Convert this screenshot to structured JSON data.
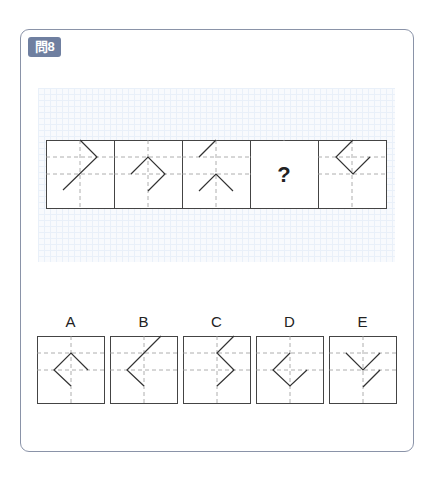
{
  "question": {
    "badge": "問8"
  },
  "sequence": {
    "panel_size": 68,
    "top": 140,
    "panels": [
      {
        "x": 46,
        "shape": [
          [
            34,
            0
          ],
          [
            51,
            17
          ],
          [
            17,
            50
          ]
        ],
        "extra": []
      },
      {
        "x": 114,
        "shape": [
          [
            17,
            34
          ],
          [
            34,
            17
          ],
          [
            51,
            34
          ],
          [
            34,
            51
          ]
        ],
        "extra": []
      },
      {
        "x": 182,
        "shape": [
          [
            34,
            0
          ],
          [
            17,
            17
          ]
        ],
        "extra": [
          [
            17,
            51
          ],
          [
            34,
            34
          ],
          [
            51,
            51
          ]
        ]
      },
      {
        "x": 250,
        "question_mark": "?",
        "shape": [],
        "extra": []
      },
      {
        "x": 318,
        "shape": [
          [
            35,
            0
          ],
          [
            18,
            17
          ],
          [
            35,
            34
          ],
          [
            52,
            17
          ]
        ],
        "extra": []
      }
    ]
  },
  "options": {
    "panel_size": 67,
    "top": 336,
    "items": [
      {
        "label": "A",
        "x": 37,
        "shape": [
          [
            34,
            50
          ],
          [
            17,
            34
          ],
          [
            34,
            17
          ],
          [
            51,
            34
          ]
        ],
        "extra": []
      },
      {
        "label": "B",
        "x": 110,
        "shape": [
          [
            51,
            0
          ],
          [
            17,
            34
          ],
          [
            34,
            50
          ]
        ],
        "extra": []
      },
      {
        "label": "C",
        "x": 183,
        "shape": [
          [
            51,
            0
          ],
          [
            34,
            17
          ],
          [
            51,
            34
          ],
          [
            34,
            50
          ]
        ],
        "extra": []
      },
      {
        "label": "D",
        "x": 256,
        "shape": [
          [
            34,
            17
          ],
          [
            17,
            34
          ],
          [
            34,
            50
          ],
          [
            51,
            34
          ]
        ],
        "extra": []
      },
      {
        "label": "E",
        "x": 329,
        "shape": [
          [
            17,
            17
          ],
          [
            34,
            34
          ],
          [
            51,
            17
          ]
        ],
        "extra": [
          [
            51,
            34
          ],
          [
            34,
            51
          ]
        ]
      }
    ]
  },
  "colors": {
    "frame": "#8a93a8",
    "badge": "#6f7fa0",
    "line": "#333333",
    "dash": "#9a9a9a"
  }
}
